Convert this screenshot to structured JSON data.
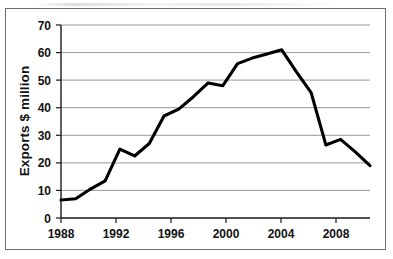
{
  "chart_data": {
    "type": "line",
    "title": "",
    "xlabel": "",
    "ylabel": "Exports $ million",
    "xlim": [
      1988,
      2009
    ],
    "ylim": [
      0,
      70
    ],
    "grid": true,
    "legend": false,
    "x_tick_labels": [
      "1988",
      "1992",
      "1996",
      "2000",
      "2004",
      "2008"
    ],
    "x_tick_values": [
      1988,
      1992,
      1996,
      2000,
      2004,
      2008
    ],
    "y_tick_labels": [
      "0",
      "10",
      "20",
      "30",
      "40",
      "50",
      "60",
      "70"
    ],
    "y_tick_values": [
      0,
      10,
      20,
      30,
      40,
      50,
      60,
      70
    ],
    "x": [
      1988,
      1989,
      1990,
      1991,
      1992,
      1993,
      1994,
      1995,
      1996,
      1997,
      1998,
      1999,
      2000,
      2001,
      2002,
      2003,
      2004,
      2005,
      2006,
      2007,
      2008,
      2009
    ],
    "values": [
      6.5,
      7,
      10.5,
      13.5,
      25,
      22.5,
      27,
      37,
      39.5,
      44,
      49,
      48,
      56,
      58,
      59.5,
      61,
      53,
      45.5,
      26.5,
      28.5,
      24,
      19
    ],
    "series": [
      {
        "name": "Exports $ million",
        "values": [
          6.5,
          7,
          10.5,
          13.5,
          25,
          22.5,
          27,
          37,
          39.5,
          44,
          49,
          48,
          56,
          58,
          59.5,
          61,
          53,
          45.5,
          26.5,
          28.5,
          24,
          19
        ]
      }
    ],
    "line_color": "#000000",
    "grid_color": "#9a9a9a",
    "axis_color": "#1a1a1a",
    "background_color": "#ffffff"
  }
}
